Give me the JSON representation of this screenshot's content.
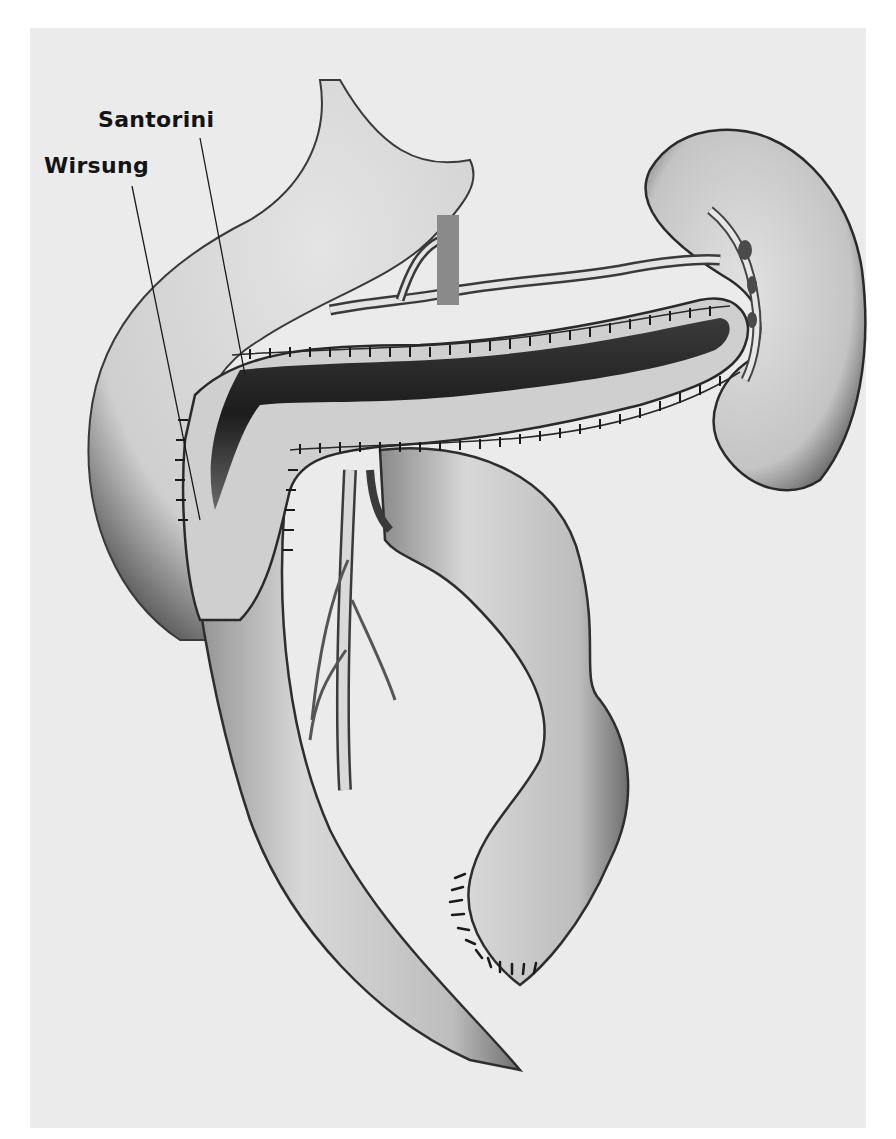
{
  "figure": {
    "type": "anatomical-illustration",
    "background_color": "#ebebeb",
    "ink_color": "#141414",
    "labels": [
      {
        "id": "santorini",
        "text": "Santorini",
        "pointer_from": [
          200,
          138
        ],
        "pointer_to": [
          245,
          375
        ]
      },
      {
        "id": "wirsung",
        "text": "Wirsung",
        "pointer_from": [
          132,
          186
        ],
        "pointer_to": [
          200,
          520
        ]
      }
    ],
    "signature": "(illegible artist signature)"
  }
}
